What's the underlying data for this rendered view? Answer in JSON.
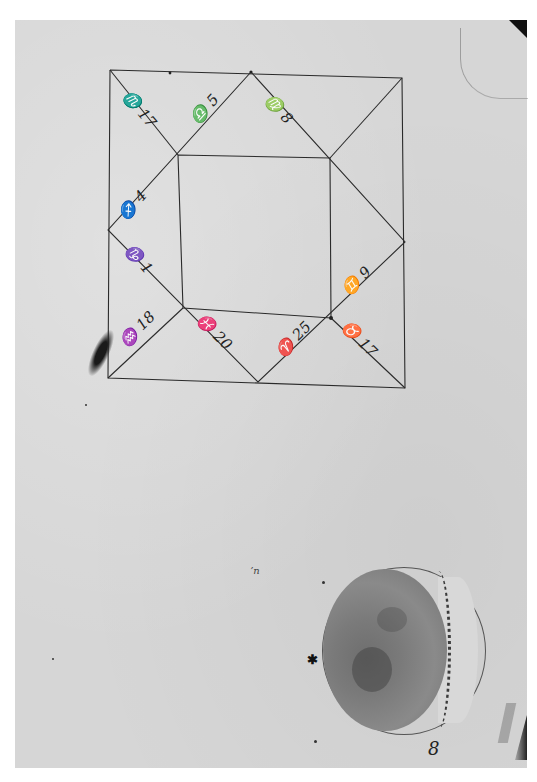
{
  "document": {
    "type": "manuscript page",
    "colors": {
      "paper": "#d6d6d6",
      "ink": "#222222",
      "moon_dark": "#7a7a7a",
      "moon_light": "#d8d8d8"
    }
  },
  "horoscope_chart": {
    "shape": "square chart with inner square and diagonal house divisions",
    "labels": [
      {
        "id": "top-left-a",
        "text": "♏ 17"
      },
      {
        "id": "top-left-b",
        "text": "♎ 5"
      },
      {
        "id": "top-right",
        "text": "♍ 8"
      },
      {
        "id": "left-upper",
        "text": "♐ 4"
      },
      {
        "id": "left-lower",
        "text": "♑ 1"
      },
      {
        "id": "bottom-left",
        "text": "♒ 18"
      },
      {
        "id": "bottom-mid-left",
        "text": "♓ 20"
      },
      {
        "id": "bottom-mid-right",
        "text": "♈ 25"
      },
      {
        "id": "right-lower",
        "text": "♉ 17"
      },
      {
        "id": "right-upper",
        "text": "♊ 9"
      }
    ]
  },
  "moon_drawing": {
    "phase": "crescent, lit on right",
    "star_marker": "✱"
  },
  "pencil_mark": "ʼn",
  "plate_number": "8"
}
